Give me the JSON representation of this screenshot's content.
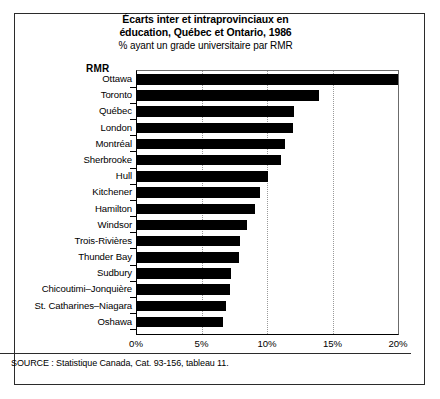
{
  "chart_data": {
    "type": "bar",
    "orientation": "horizontal",
    "title": "Écarts inter et intraprovinciaux en éducation, Québec et Ontario, 1986",
    "title_lines": [
      "Écarts inter et intraprovinciaux en",
      "éducation, Québec et Ontario, 1986"
    ],
    "subtitle": "% ayant un grade universitaire par RMR",
    "category_axis_label": "RMR",
    "xlabel": "",
    "ylabel": "",
    "xlim": [
      0,
      20
    ],
    "xtick_labels": [
      "0%",
      "5%",
      "10%",
      "15%",
      "20%"
    ],
    "xticks": [
      0,
      5,
      10,
      15,
      20
    ],
    "grid": "vertical-dotted",
    "legend": "none",
    "bar_color": "#000000",
    "categories": [
      "Ottawa",
      "Toronto",
      "Québec",
      "London",
      "Montréal",
      "Sherbrooke",
      "Hull",
      "Kitchener",
      "Hamilton",
      "Windsor",
      "Trois-Rivières",
      "Thunder Bay",
      "Sudbury",
      "Chicoutimi–Jonquière",
      "St. Catharines–Niagara",
      "Oshawa"
    ],
    "values": [
      19.9,
      13.9,
      12.0,
      11.9,
      11.3,
      11.0,
      10.0,
      9.4,
      9.0,
      8.4,
      7.9,
      7.8,
      7.2,
      7.1,
      6.8,
      6.6
    ],
    "source": "SOURCE : Statistique Canada, Cat. 93-156, tableau 11."
  }
}
